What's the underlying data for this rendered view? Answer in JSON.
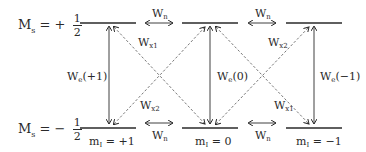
{
  "diagram": {
    "levels": {
      "top": {
        "ms_label": "M",
        "ms_sub": "s",
        "ms_sign": "= +",
        "ms_num": "1",
        "ms_den": "2"
      },
      "bottom": {
        "ms_label": "M",
        "ms_sub": "s",
        "ms_sign": "= −",
        "ms_num": "1",
        "ms_den": "2"
      }
    },
    "ml_labels": [
      {
        "text": "m",
        "sub": "I",
        "value": " = +1"
      },
      {
        "text": "m",
        "sub": "I",
        "value": " = 0"
      },
      {
        "text": "m",
        "sub": "I",
        "value": " = −1"
      }
    ],
    "transitions": {
      "wn_top_1": {
        "main": "W",
        "sub": "n"
      },
      "wn_top_2": {
        "main": "W",
        "sub": "n"
      },
      "wn_bot_1": {
        "main": "W",
        "sub": "n"
      },
      "wn_bot_2": {
        "main": "W",
        "sub": "n"
      },
      "wx1_top": {
        "main": "W",
        "sub": "x1"
      },
      "wx2_top": {
        "main": "W",
        "sub": "x2"
      },
      "wx2_bot": {
        "main": "W",
        "sub": "x2"
      },
      "wx1_bot": {
        "main": "W",
        "sub": "x1"
      },
      "we_plus1": {
        "main": "W",
        "sub": "e",
        "arg": "(+1)"
      },
      "we_0": {
        "main": "W",
        "sub": "e",
        "arg": "(0)"
      },
      "we_minus1": {
        "main": "W",
        "sub": "e",
        "arg": "(−1)"
      }
    },
    "colors": {
      "line": "#2a2a2a",
      "dashed": "#555555",
      "background": "#ffffff"
    }
  }
}
